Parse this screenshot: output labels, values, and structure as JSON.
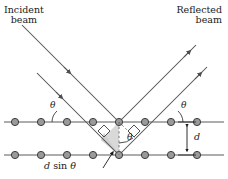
{
  "figure": {
    "kind": "bragg-diffraction-diagram",
    "labels": {
      "incident_line1": "Incident",
      "incident_line2": "beam",
      "reflected_line1": "Reflected",
      "reflected_line2": "beam",
      "theta_left": "θ",
      "theta_right": "θ",
      "theta_center": "θ",
      "spacing": "d",
      "path_difference_d": "d",
      "path_difference_sin": "sin",
      "path_difference_theta": "θ",
      "path_difference_full": "d sin θ"
    },
    "colors": {
      "ray": "#4d4d4d",
      "plane_line": "#5a5a5a",
      "atom_fill": "#9a9a9a",
      "atom_stroke": "#3c3c3c",
      "shaded_region": "#d9d9d9",
      "dashed": "#6b6b6b",
      "text": "#1a1a1a",
      "background": "#ffffff"
    },
    "geometry": {
      "upper_plane_y": 122,
      "lower_plane_y": 155,
      "plane_spacing_px": 33,
      "upper_atoms_x": [
        15,
        41,
        67,
        93,
        119,
        145,
        171,
        197
      ],
      "lower_atoms_x": [
        15,
        41,
        67,
        93,
        119,
        145,
        171,
        197
      ],
      "scatter_atom_upper": {
        "x": 119,
        "y": 122
      },
      "scatter_atom_lower": {
        "x": 119,
        "y": 155
      },
      "incident_angle_deg": 45,
      "reflected_angle_deg": 45
    },
    "annotations": {
      "right_angle_marks": 2,
      "arc_marks": 3,
      "dashed_segments": 2,
      "arrow_heads_incident": 2,
      "arrow_heads_reflected": 2,
      "double_arrow_d": 1
    }
  }
}
